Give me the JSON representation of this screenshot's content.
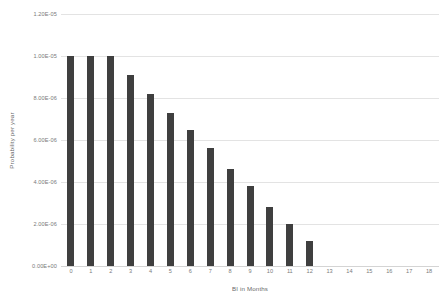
{
  "chart_data": {
    "type": "bar",
    "title": "",
    "xlabel": "BI in Months",
    "ylabel": "Probability per year",
    "categories": [
      "0",
      "1",
      "2",
      "3",
      "4",
      "5",
      "6",
      "7",
      "8",
      "9",
      "10",
      "11",
      "12"
    ],
    "values": [
      1e-05,
      1e-05,
      1e-05,
      9.1e-06,
      8.2e-06,
      7.3e-06,
      6.5e-06,
      5.6e-06,
      4.6e-06,
      3.8e-06,
      2.8e-06,
      2e-06,
      1.2e-06
    ],
    "x_tick_labels": [
      "0",
      "1",
      "2",
      "3",
      "4",
      "5",
      "6",
      "7",
      "8",
      "9",
      "10",
      "11",
      "12",
      "13",
      "14",
      "15",
      "16",
      "17",
      "18"
    ],
    "y_tick_labels": [
      "1.20E-05",
      "1.00E-05",
      "8.00E-06",
      "6.00E-06",
      "4.00E-06",
      "2.00E-06",
      "0.00E+00"
    ],
    "y_tick_values": [
      1.2e-05,
      1e-05,
      8e-06,
      6e-06,
      4e-06,
      2e-06,
      0.0
    ],
    "xlim": [
      -0.5,
      18.5
    ],
    "ylim": [
      0,
      1.2e-05
    ],
    "grid": true,
    "grid_axis": "y",
    "legend": false,
    "legend_position": "none",
    "series_color": "#3f3f3f",
    "gridline_color": "#e3e3e3",
    "background_color": "#ffffff",
    "text_color": "#7a7a7a"
  }
}
